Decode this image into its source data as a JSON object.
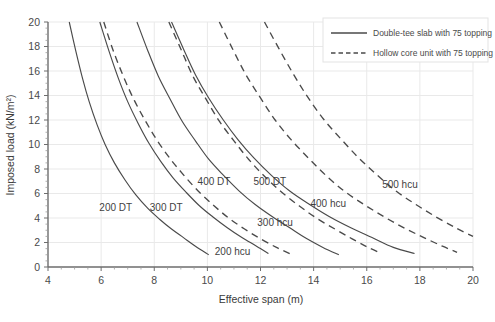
{
  "chart_data": {
    "type": "line",
    "title": "",
    "xlabel": "Effective span (m)",
    "ylabel": "Imposed load (kN/m²)",
    "xlim": [
      4,
      20
    ],
    "ylim": [
      0,
      20
    ],
    "xticks": [
      4,
      6,
      8,
      10,
      12,
      14,
      16,
      18,
      20
    ],
    "yticks": [
      0,
      2,
      4,
      6,
      8,
      10,
      12,
      14,
      16,
      18,
      20
    ],
    "x_minor_step": 0.5,
    "y_minor_step": 0.5,
    "grid": true,
    "legend_position": "top-right",
    "legend": [
      {
        "label": "Double-tee slab with 75 topping",
        "style": "solid"
      },
      {
        "label": "Hollow core unit with 75 topping",
        "style": "dashed"
      }
    ],
    "series": [
      {
        "name": "200 DT",
        "style": "solid",
        "label": "200 DT",
        "label_x": 6.55,
        "label_y": 4.55,
        "points": [
          [
            4.8,
            20.0
          ],
          [
            5.05,
            17.6
          ],
          [
            5.3,
            15.4
          ],
          [
            5.55,
            13.5
          ],
          [
            5.85,
            11.6
          ],
          [
            6.15,
            10.0
          ],
          [
            6.5,
            8.5
          ],
          [
            6.9,
            7.1
          ],
          [
            7.3,
            5.9
          ],
          [
            7.75,
            4.8
          ],
          [
            8.2,
            3.9
          ],
          [
            8.65,
            3.1
          ],
          [
            9.1,
            2.4
          ],
          [
            9.55,
            1.7
          ],
          [
            10.05,
            1.0
          ]
        ]
      },
      {
        "name": "300 DT",
        "style": "solid",
        "label": "300 DT",
        "label_x": 8.45,
        "label_y": 4.55,
        "points": [
          [
            5.95,
            20.0
          ],
          [
            6.3,
            17.6
          ],
          [
            6.65,
            15.4
          ],
          [
            7.0,
            13.5
          ],
          [
            7.4,
            11.7
          ],
          [
            7.8,
            10.1
          ],
          [
            8.25,
            8.6
          ],
          [
            8.7,
            7.3
          ],
          [
            9.2,
            6.1
          ],
          [
            9.7,
            5.0
          ],
          [
            10.2,
            4.1
          ],
          [
            10.75,
            3.2
          ],
          [
            11.3,
            2.4
          ],
          [
            11.85,
            1.7
          ],
          [
            12.3,
            1.1
          ]
        ]
      },
      {
        "name": "400 DT",
        "style": "solid",
        "label": "400 DT",
        "label_x": 10.25,
        "label_y": 6.7,
        "points": [
          [
            7.35,
            20.0
          ],
          [
            7.75,
            17.7
          ],
          [
            8.15,
            15.6
          ],
          [
            8.6,
            13.7
          ],
          [
            9.05,
            11.9
          ],
          [
            9.55,
            10.3
          ],
          [
            10.05,
            8.8
          ],
          [
            10.6,
            7.5
          ],
          [
            11.2,
            6.2
          ],
          [
            11.8,
            5.1
          ],
          [
            12.45,
            4.1
          ],
          [
            13.1,
            3.2
          ],
          [
            13.75,
            2.3
          ],
          [
            14.35,
            1.6
          ],
          [
            14.95,
            1.0
          ]
        ]
      },
      {
        "name": "500 DT",
        "style": "solid",
        "label": "500 DT",
        "label_x": 12.35,
        "label_y": 6.7,
        "points": [
          [
            8.65,
            20.0
          ],
          [
            9.1,
            17.8
          ],
          [
            9.55,
            15.7
          ],
          [
            10.05,
            13.8
          ],
          [
            10.6,
            12.0
          ],
          [
            11.15,
            10.4
          ],
          [
            11.75,
            8.9
          ],
          [
            12.4,
            7.5
          ],
          [
            13.1,
            6.2
          ],
          [
            13.85,
            5.1
          ],
          [
            14.6,
            4.1
          ],
          [
            15.4,
            3.2
          ],
          [
            16.2,
            2.4
          ],
          [
            17.0,
            1.6
          ],
          [
            17.8,
            1.1
          ]
        ]
      },
      {
        "name": "200 hcu",
        "style": "dashed",
        "label": "200 hcu",
        "label_x": 10.95,
        "label_y": 0.95,
        "points": [
          [
            6.1,
            20.0
          ],
          [
            6.45,
            17.7
          ],
          [
            6.85,
            15.5
          ],
          [
            7.25,
            13.6
          ],
          [
            7.7,
            11.8
          ],
          [
            8.15,
            10.2
          ],
          [
            8.65,
            8.7
          ],
          [
            9.15,
            7.4
          ],
          [
            9.7,
            6.1
          ],
          [
            10.25,
            5.0
          ],
          [
            10.8,
            4.0
          ],
          [
            11.4,
            3.1
          ],
          [
            12.0,
            2.3
          ],
          [
            12.6,
            1.6
          ],
          [
            13.1,
            1.1
          ]
        ]
      },
      {
        "name": "300 hcu",
        "style": "dashed",
        "label": "300 hcu",
        "label_x": 12.55,
        "label_y": 3.35,
        "points": [
          [
            8.55,
            20.0
          ],
          [
            9.0,
            17.8
          ],
          [
            9.45,
            15.6
          ],
          [
            9.95,
            13.7
          ],
          [
            10.45,
            11.9
          ],
          [
            11.0,
            10.3
          ],
          [
            11.55,
            8.8
          ],
          [
            12.15,
            7.4
          ],
          [
            12.8,
            6.1
          ],
          [
            13.45,
            5.0
          ],
          [
            14.1,
            4.0
          ],
          [
            14.8,
            3.1
          ],
          [
            15.45,
            2.3
          ],
          [
            16.05,
            1.6
          ],
          [
            16.55,
            1.1
          ]
        ]
      },
      {
        "name": "400 hcu",
        "style": "dashed",
        "label": "400 hcu",
        "label_x": 14.55,
        "label_y": 4.9,
        "points": [
          [
            10.45,
            20.0
          ],
          [
            10.95,
            17.8
          ],
          [
            11.45,
            15.7
          ],
          [
            12.0,
            13.8
          ],
          [
            12.55,
            12.0
          ],
          [
            13.15,
            10.4
          ],
          [
            13.8,
            8.9
          ],
          [
            14.45,
            7.5
          ],
          [
            15.15,
            6.2
          ],
          [
            15.9,
            5.1
          ],
          [
            16.65,
            4.1
          ],
          [
            17.4,
            3.2
          ],
          [
            18.15,
            2.4
          ],
          [
            18.85,
            1.7
          ],
          [
            19.4,
            1.2
          ]
        ]
      },
      {
        "name": "500 hcu",
        "style": "dashed",
        "label": "500 hcu",
        "label_x": 17.25,
        "label_y": 6.45,
        "points": [
          [
            12.15,
            20.0
          ],
          [
            12.7,
            17.8
          ],
          [
            13.25,
            15.7
          ],
          [
            13.8,
            13.8
          ],
          [
            14.4,
            12.0
          ],
          [
            15.05,
            10.4
          ],
          [
            15.7,
            8.9
          ],
          [
            16.4,
            7.5
          ],
          [
            17.1,
            6.2
          ],
          [
            17.85,
            5.1
          ],
          [
            18.6,
            4.1
          ],
          [
            19.35,
            3.2
          ],
          [
            20.0,
            2.5
          ]
        ]
      }
    ]
  }
}
